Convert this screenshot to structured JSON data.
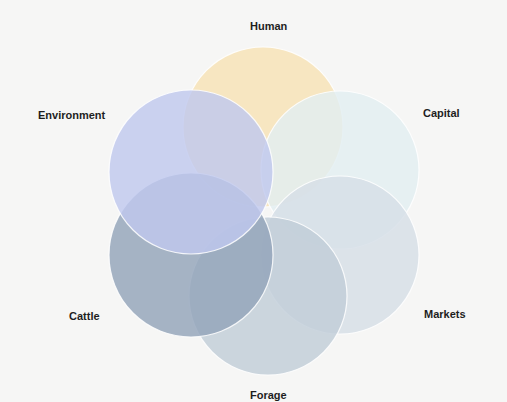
{
  "diagram": {
    "type": "six-circle overlapping venn / flower diagram",
    "background_color": "#f6f6f5",
    "stroke_color": "#ffffff",
    "circles": [
      {
        "id": "human",
        "label": "Human",
        "color": "#f6e2b6",
        "cx": 263,
        "cy": 127,
        "r": 80
      },
      {
        "id": "capital",
        "label": "Capital",
        "color": "#e2eef1",
        "cx": 340,
        "cy": 170,
        "r": 79
      },
      {
        "id": "markets",
        "label": "Markets",
        "color": "#d6dee7",
        "cx": 340,
        "cy": 255,
        "r": 79
      },
      {
        "id": "forage",
        "label": "Forage",
        "color": "#c1cdd8",
        "cx": 268,
        "cy": 296,
        "r": 79
      },
      {
        "id": "cattle",
        "label": "Cattle",
        "color": "#93a4ba",
        "cx": 191,
        "cy": 255,
        "r": 82
      },
      {
        "id": "environment",
        "label": "Environment",
        "color": "#bfc8ee",
        "cx": 191,
        "cy": 172,
        "r": 82
      }
    ]
  },
  "labels": {
    "human": "Human",
    "environment": "Environment",
    "capital": "Capital",
    "cattle": "Cattle",
    "markets": "Markets",
    "forage": "Forage"
  }
}
